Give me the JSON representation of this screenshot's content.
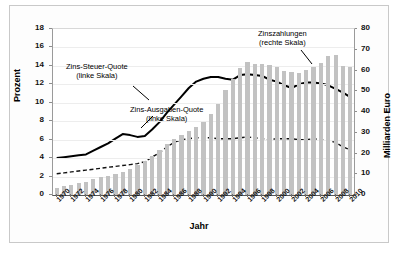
{
  "chart_data": {
    "type": "line",
    "title": "",
    "xlabel": "Jahr",
    "ylabel": "Prozent",
    "ylabel_right": "Milliarden Euro",
    "grid": true,
    "legend_position": "inline-annotations",
    "x": [
      1970,
      1971,
      1972,
      1973,
      1974,
      1975,
      1976,
      1977,
      1978,
      1979,
      1980,
      1981,
      1982,
      1983,
      1984,
      1985,
      1986,
      1987,
      1988,
      1989,
      1990,
      1991,
      1992,
      1993,
      1994,
      1995,
      1996,
      1997,
      1998,
      1999,
      2000,
      2001,
      2002,
      2003,
      2004,
      2005,
      2006,
      2007,
      2008,
      2009,
      2010
    ],
    "xtick_labels": [
      "1970",
      "1972",
      "1974",
      "1976",
      "1978",
      "1980",
      "1982",
      "1984",
      "1986",
      "1988",
      "1990",
      "1992",
      "1994",
      "1996",
      "1998",
      "2000",
      "2002",
      "2004",
      "2006",
      "2008",
      "2010"
    ],
    "ylim": [
      0,
      18
    ],
    "ytick_labels": [
      "0",
      "2",
      "4",
      "6",
      "8",
      "10",
      "12",
      "14",
      "16",
      "18"
    ],
    "ylim_right": [
      0,
      80
    ],
    "ytick_labels_right": [
      "0",
      "10",
      "20",
      "30",
      "40",
      "50",
      "60",
      "70",
      "80"
    ],
    "series": [
      {
        "name": "Zins-Steuer-Quote",
        "label": "Zins-Steuer-Quote",
        "sublabel": "(linke Skala)",
        "axis": "left",
        "style": "solid-line",
        "color": "#000000",
        "values": [
          4.0,
          4.1,
          4.2,
          4.3,
          4.4,
          4.8,
          5.2,
          5.6,
          6.1,
          6.6,
          6.5,
          6.3,
          6.4,
          7.1,
          7.9,
          8.9,
          9.8,
          10.7,
          11.6,
          12.3,
          12.6,
          12.8,
          12.8,
          12.6,
          12.5,
          13.0,
          13.1,
          13.0,
          12.9,
          12.5,
          12.3,
          11.9,
          11.6,
          12.0,
          12.2,
          12.2,
          12.1,
          11.9,
          11.5,
          11.1,
          10.6
        ]
      },
      {
        "name": "Zins-Ausgaben-Quote",
        "label": "Zins-Ausgaben-Quote",
        "sublabel": "(linke Skala)",
        "axis": "left",
        "style": "dashed-line",
        "color": "#111111",
        "values": [
          2.3,
          2.4,
          2.5,
          2.6,
          2.7,
          2.8,
          2.9,
          3.0,
          3.1,
          3.2,
          3.3,
          3.4,
          3.6,
          4.1,
          4.6,
          5.2,
          5.7,
          6.0,
          6.1,
          6.2,
          6.2,
          6.2,
          6.1,
          6.1,
          6.1,
          6.2,
          6.3,
          6.2,
          6.1,
          6.0,
          6.1,
          6.1,
          6.1,
          6.0,
          6.0,
          6.1,
          6.0,
          5.9,
          5.7,
          5.2,
          4.9
        ]
      },
      {
        "name": "Zinszahlungen",
        "label": "Zinszahlungen",
        "sublabel": "(rechte Skala)",
        "axis": "right",
        "style": "bars",
        "color": "#c2c2c2",
        "values": [
          3.5,
          4.2,
          4.8,
          5.6,
          6.4,
          7.5,
          8.5,
          9.4,
          10.3,
          11.3,
          12.7,
          14.4,
          16.5,
          19.0,
          21.7,
          24.4,
          26.8,
          28.9,
          30.9,
          32.6,
          35.2,
          38.9,
          44.1,
          50.5,
          55.9,
          61.0,
          64.0,
          63.0,
          63.0,
          62.8,
          61.5,
          60.0,
          59.5,
          59.0,
          60.2,
          61.5,
          63.5,
          67.0,
          67.5,
          62.0,
          61.5
        ]
      }
    ],
    "annotations": [
      {
        "text": "Zins-Steuer-Quote",
        "sub": "(linke Skala)"
      },
      {
        "text": "Zins-Ausgaben-Quote",
        "sub": "(linke Skala)"
      },
      {
        "text": "Zinszahlungen",
        "sub": "(rechte Skala)"
      }
    ]
  }
}
